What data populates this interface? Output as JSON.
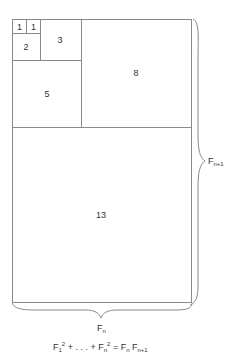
{
  "figure": {
    "squares": [
      {
        "label": "1"
      },
      {
        "label": "1"
      },
      {
        "label": "2"
      },
      {
        "label": "3"
      },
      {
        "label": "5"
      },
      {
        "label": "8"
      },
      {
        "label": "13"
      }
    ],
    "width_label": {
      "base": "F",
      "sub": "n"
    },
    "height_label": {
      "base": "F",
      "sub": "n+1"
    },
    "identity": {
      "term1_base": "F",
      "term1_sub": "1",
      "term1_sup": "2",
      "ellipsis": " + . . . + ",
      "termn_base": "F",
      "termn_sub": "n",
      "termn_sup": "2",
      "equals": " = ",
      "rhs1_base": "F",
      "rhs1_sub": "n",
      "rhs2_base": " F",
      "rhs2_sub": "n+1"
    }
  }
}
